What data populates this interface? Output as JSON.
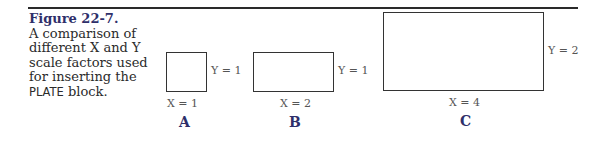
{
  "figure": {
    "title": "Figure 22-7.",
    "caption_lines": [
      "A comparison of",
      "different X and Y",
      "scale factors used",
      "for inserting the"
    ],
    "caption_last_sans": "PLATE",
    "caption_last_rest": " block.",
    "colors": {
      "title": "#2f2f6a",
      "rule": "#2a2a2a",
      "box": "#333333"
    }
  },
  "panels": [
    {
      "id": "A",
      "x_label": "X = 1",
      "y_label": "Y = 1",
      "letter": "A"
    },
    {
      "id": "B",
      "x_label": "X = 2",
      "y_label": "Y = 1",
      "letter": "B"
    },
    {
      "id": "C",
      "x_label": "X = 4",
      "y_label": "Y = 2",
      "letter": "C"
    }
  ]
}
